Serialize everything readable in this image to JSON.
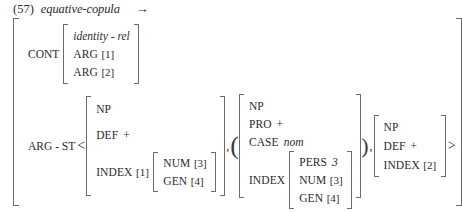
{
  "header": {
    "example_number": "(57)",
    "type_name": "equative-copula",
    "arrow": "→"
  },
  "cont": {
    "label": "CONT",
    "type": "identity - rel",
    "features": [
      {
        "attr": "ARG",
        "tag": "[1]"
      },
      {
        "attr": "ARG",
        "tag": "[2]"
      }
    ]
  },
  "arg_st": {
    "label": "ARG - ST",
    "angle_open": "<",
    "angle_close": ">",
    "separator_1": ",",
    "separator_2": ",",
    "paren_open": "(",
    "paren_close": ")",
    "elements": [
      {
        "name": "first-argument",
        "optional": false,
        "rows": [
          {
            "attr": "NP",
            "value": ""
          },
          {
            "attr": "DEF",
            "value": "+"
          }
        ],
        "index": {
          "attr": "INDEX",
          "tag": "[1]",
          "rows": [
            {
              "attr": "NUM",
              "tag": "[3]"
            },
            {
              "attr": "GEN",
              "tag": "[4]"
            }
          ]
        }
      },
      {
        "name": "second-argument",
        "optional": true,
        "rows": [
          {
            "attr": "NP",
            "value": ""
          },
          {
            "attr": "PRO",
            "value": "+"
          },
          {
            "attr": "CASE",
            "value": "nom",
            "italic": true
          }
        ],
        "index": {
          "attr": "INDEX",
          "tag": "",
          "rows": [
            {
              "attr": "PERS",
              "value": "3",
              "italic": true
            },
            {
              "attr": "NUM",
              "tag": "[3]"
            },
            {
              "attr": "GEN",
              "tag": "[4]"
            }
          ]
        }
      },
      {
        "name": "third-argument",
        "optional": false,
        "rows": [
          {
            "attr": "NP",
            "value": ""
          },
          {
            "attr": "DEF",
            "value": "+"
          },
          {
            "attr": "INDEX",
            "tag": "[2]"
          }
        ]
      }
    ]
  },
  "colors": {
    "ink": "#2b2b2b",
    "bracket": "#6c6c6c",
    "background": "#ffffff"
  }
}
